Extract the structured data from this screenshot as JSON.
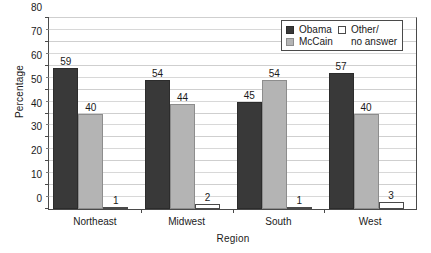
{
  "chart_data": {
    "type": "bar",
    "title": "",
    "subtitle": "",
    "xlabel": "Region",
    "ylabel": "Percentage",
    "categories": [
      "Northeast",
      "Midwest",
      "South",
      "West"
    ],
    "series": [
      {
        "name": "Obama",
        "color": "#393939",
        "values": [
          59,
          54,
          45,
          57
        ]
      },
      {
        "name": "McCain",
        "color": "#b4b4b4",
        "values": [
          40,
          44,
          54,
          40
        ]
      },
      {
        "name": "Other/ no answer",
        "color": "#ffffff",
        "values": [
          1,
          2,
          1,
          3
        ]
      }
    ],
    "ylim": [
      0,
      80
    ],
    "y_major_step": 10,
    "y_minor_step": 5,
    "y_ticks": [
      0,
      10,
      20,
      30,
      40,
      50,
      60,
      70,
      80
    ],
    "y_tick_labels": [
      "0",
      "10",
      "20",
      "30",
      "40",
      "50",
      "60",
      "70",
      "80"
    ],
    "grid": true,
    "grid_axis": "y",
    "legend_position": "top-right",
    "data_labels": true
  },
  "legend": {
    "entries": [
      {
        "label": "Obama",
        "swatch": "obama"
      },
      {
        "label": "Other/",
        "swatch": "other"
      },
      {
        "label": "McCain",
        "swatch": "mccain"
      },
      {
        "label": "no answer",
        "swatch": "blank"
      }
    ]
  }
}
